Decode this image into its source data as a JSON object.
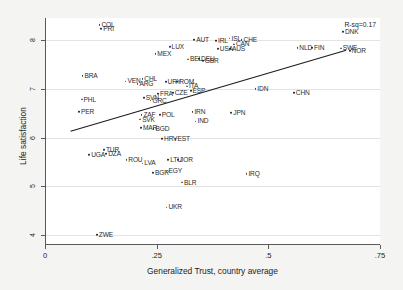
{
  "chart_data": {
    "type": "scatter",
    "title": "",
    "xlabel": "Generalized Trust, country average",
    "ylabel": "Life satisfaction",
    "xlim": [
      0,
      0.75
    ],
    "ylim": [
      3.8,
      8.45
    ],
    "xticks": [
      "0",
      ".25",
      ".5",
      ".75"
    ],
    "xtick_values": [
      0,
      0.25,
      0.5,
      0.75
    ],
    "yticks": [
      "4",
      "5",
      "6",
      "7",
      "8"
    ],
    "ytick_values": [
      4,
      5,
      6,
      7,
      8
    ],
    "grid": "horizontal",
    "annotation": "R-sq=0.17",
    "fit_line": {
      "type": "linear",
      "x_start": 0.055,
      "y_start": 6.13,
      "x_end": 0.672,
      "y_end": 7.79
    },
    "point_label_field": "country_code",
    "points": [
      {
        "label": "COL",
        "x": 0.118,
        "y": 8.31
      },
      {
        "label": "PRI",
        "x": 0.122,
        "y": 8.22
      },
      {
        "label": "DNK",
        "x": 0.663,
        "y": 8.16
      },
      {
        "label": "AUT",
        "x": 0.33,
        "y": 8.0
      },
      {
        "label": "ISL",
        "x": 0.409,
        "y": 8.03
      },
      {
        "label": "CHE",
        "x": 0.436,
        "y": 8.0
      },
      {
        "label": "IRL",
        "x": 0.379,
        "y": 7.98
      },
      {
        "label": "CAN",
        "x": 0.419,
        "y": 7.91
      },
      {
        "label": "LUX",
        "x": 0.275,
        "y": 7.86
      },
      {
        "label": "NLD",
        "x": 0.561,
        "y": 7.84
      },
      {
        "label": "FIN",
        "x": 0.594,
        "y": 7.84
      },
      {
        "label": "SWE",
        "x": 0.658,
        "y": 7.83
      },
      {
        "label": "NOR",
        "x": 0.678,
        "y": 7.78
      },
      {
        "label": "USA",
        "x": 0.383,
        "y": 7.81
      },
      {
        "label": "AUS",
        "x": 0.41,
        "y": 7.81
      },
      {
        "label": "MEX",
        "x": 0.243,
        "y": 7.72
      },
      {
        "label": "BEL",
        "x": 0.316,
        "y": 7.6
      },
      {
        "label": "DEU",
        "x": 0.341,
        "y": 7.61
      },
      {
        "label": "GBR",
        "x": 0.349,
        "y": 7.57
      },
      {
        "label": "BRA",
        "x": 0.08,
        "y": 7.27
      },
      {
        "label": "CHL",
        "x": 0.214,
        "y": 7.2
      },
      {
        "label": "VEN",
        "x": 0.176,
        "y": 7.15
      },
      {
        "label": "ARG",
        "x": 0.203,
        "y": 7.1
      },
      {
        "label": "URY",
        "x": 0.266,
        "y": 7.14
      },
      {
        "label": "ROM",
        "x": 0.292,
        "y": 7.14
      },
      {
        "label": "ITA",
        "x": 0.314,
        "y": 7.05
      },
      {
        "label": "IDN",
        "x": 0.467,
        "y": 7.0
      },
      {
        "label": "CHN",
        "x": 0.553,
        "y": 6.92
      },
      {
        "label": "ESP",
        "x": 0.322,
        "y": 6.95
      },
      {
        "label": "CZE",
        "x": 0.282,
        "y": 6.92
      },
      {
        "label": "FRA",
        "x": 0.249,
        "y": 6.89
      },
      {
        "label": "SVN",
        "x": 0.217,
        "y": 6.82
      },
      {
        "label": "PHL",
        "x": 0.078,
        "y": 6.78
      },
      {
        "label": "GRC",
        "x": 0.232,
        "y": 6.76
      },
      {
        "label": "PER",
        "x": 0.072,
        "y": 6.52
      },
      {
        "label": "ZAF",
        "x": 0.212,
        "y": 6.46
      },
      {
        "label": "POL",
        "x": 0.253,
        "y": 6.46
      },
      {
        "label": "IRN",
        "x": 0.326,
        "y": 6.52
      },
      {
        "label": "JPN",
        "x": 0.413,
        "y": 6.5
      },
      {
        "label": "SVK",
        "x": 0.209,
        "y": 6.37
      },
      {
        "label": "IND",
        "x": 0.333,
        "y": 6.33
      },
      {
        "label": "MAR",
        "x": 0.211,
        "y": 6.2
      },
      {
        "label": "BGD",
        "x": 0.239,
        "y": 6.18
      },
      {
        "label": "HRV",
        "x": 0.258,
        "y": 5.97
      },
      {
        "label": "EST",
        "x": 0.288,
        "y": 5.97
      },
      {
        "label": "TUR",
        "x": 0.128,
        "y": 5.75
      },
      {
        "label": "DZA",
        "x": 0.133,
        "y": 5.67
      },
      {
        "label": "UGA",
        "x": 0.095,
        "y": 5.65
      },
      {
        "label": "ROU",
        "x": 0.178,
        "y": 5.54
      },
      {
        "label": "LVA",
        "x": 0.214,
        "y": 5.47
      },
      {
        "label": "LTU",
        "x": 0.272,
        "y": 5.55
      },
      {
        "label": "JOR",
        "x": 0.294,
        "y": 5.55
      },
      {
        "label": "BGR",
        "x": 0.238,
        "y": 5.27
      },
      {
        "label": "EGY",
        "x": 0.268,
        "y": 5.31
      },
      {
        "label": "IRQ",
        "x": 0.447,
        "y": 5.25
      },
      {
        "label": "BLR",
        "x": 0.303,
        "y": 5.08
      },
      {
        "label": "UKR",
        "x": 0.268,
        "y": 4.57
      },
      {
        "label": "ZWE",
        "x": 0.112,
        "y": 4.0
      }
    ]
  },
  "axes": {
    "xlabel": "Generalized Trust, country average",
    "ylabel": "Life satisfaction"
  },
  "annotation": {
    "rsq": "R-sq=0.17"
  }
}
